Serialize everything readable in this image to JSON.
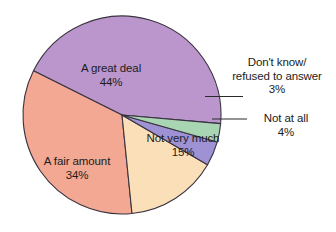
{
  "chart_data": {
    "type": "pie",
    "title": "",
    "subtitle": "",
    "xlabel": "",
    "ylabel": "",
    "legend_position": "none",
    "grid": false,
    "labels_format": "label + percent",
    "categories": [
      "A great deal",
      "A fair amount",
      "Not very much",
      "Not at all",
      "Don't know/ refused to answer"
    ],
    "values": [
      44,
      34,
      15,
      4,
      3
    ],
    "units": "%",
    "total": 100,
    "slices": [
      {
        "id": "great-deal",
        "label": "A great deal",
        "label_lines": [
          "A great deal"
        ],
        "value": 44,
        "percent_text": "44%",
        "color": "#bb96cc",
        "placement": "inside",
        "has_leader_line": false
      },
      {
        "id": "fair-amount",
        "label": "A fair amount",
        "label_lines": [
          "A fair amount"
        ],
        "value": 34,
        "percent_text": "34%",
        "color": "#f3a893",
        "placement": "inside",
        "has_leader_line": false
      },
      {
        "id": "not-very-much",
        "label": "Not very much",
        "label_lines": [
          "Not very much"
        ],
        "value": 15,
        "percent_text": "15%",
        "color": "#fbdfb8",
        "placement": "inside",
        "has_leader_line": false
      },
      {
        "id": "not-at-all",
        "label": "Not at all",
        "label_lines": [
          "Not at all"
        ],
        "value": 4,
        "percent_text": "4%",
        "color": "#9e92d4",
        "placement": "outside",
        "has_leader_line": true
      },
      {
        "id": "dont-know",
        "label": "Don't know/ refused to answer",
        "label_lines": [
          "Don't know/",
          "refused to answer"
        ],
        "value": 3,
        "percent_text": "3%",
        "color": "#a9d6b2",
        "placement": "outside",
        "has_leader_line": true
      }
    ],
    "colors": {
      "background": "#ffffff",
      "outline": "#3a3340",
      "text": "#1c1c1c",
      "leader_line": "#2b2b2b"
    }
  }
}
